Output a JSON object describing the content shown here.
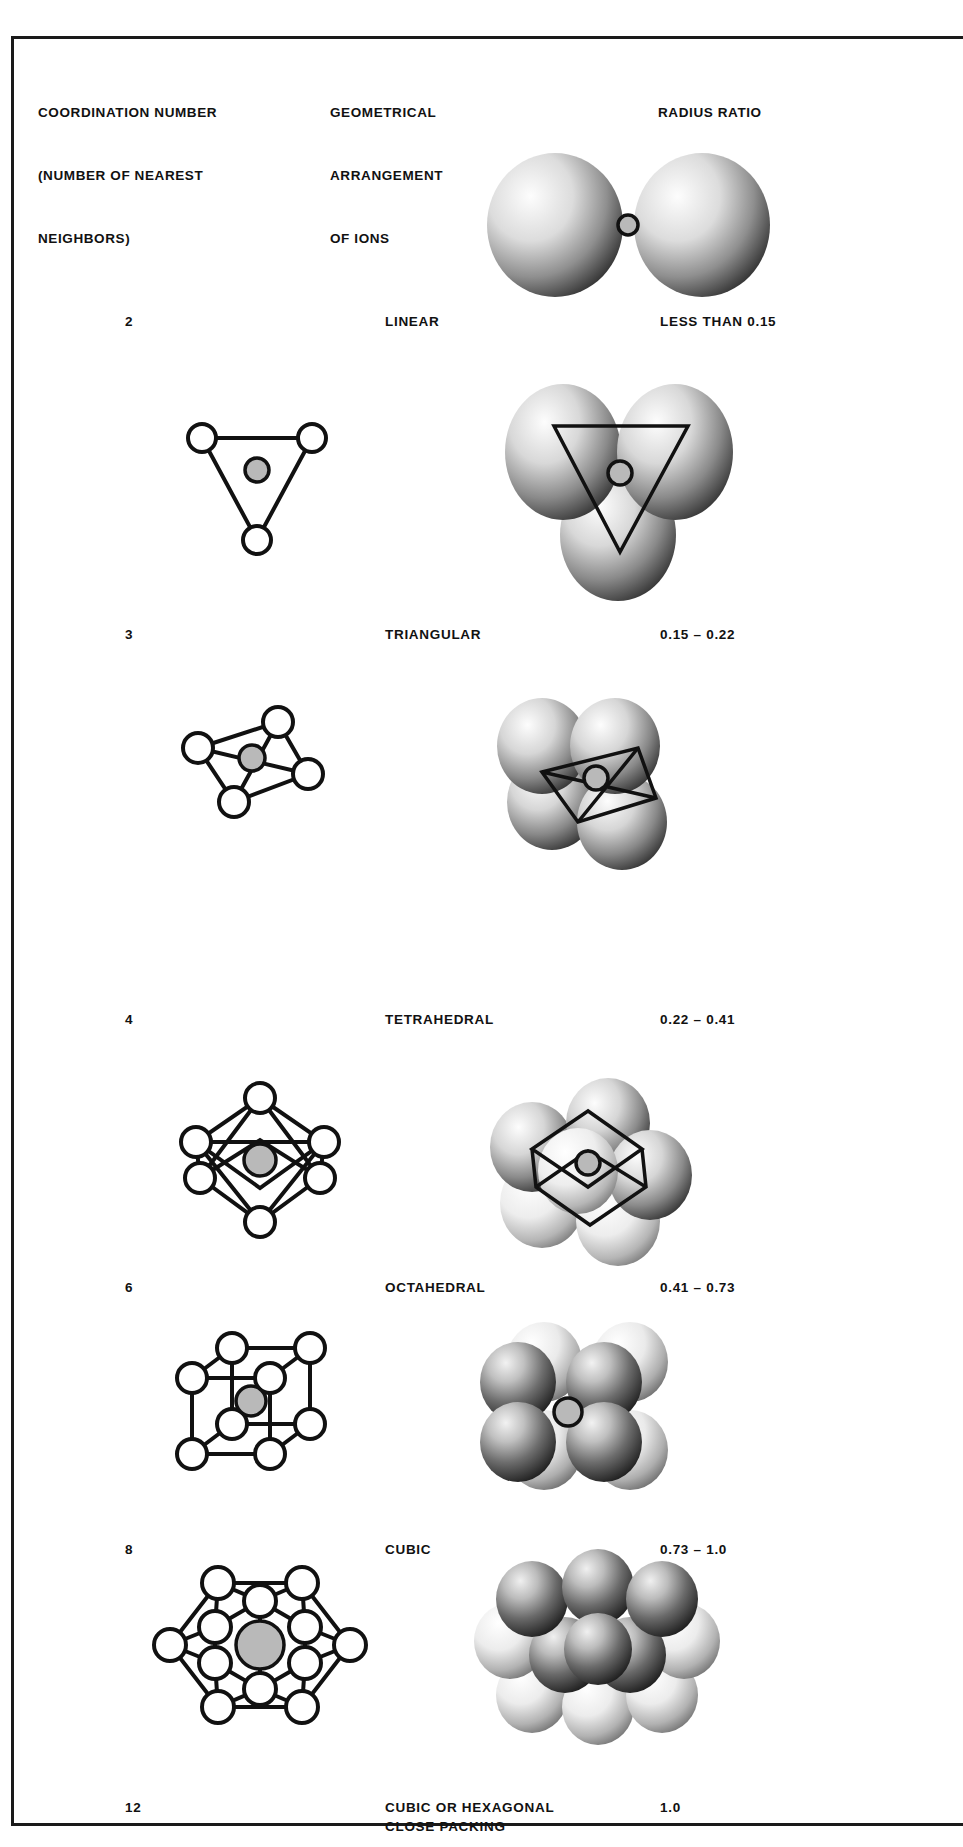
{
  "figure": {
    "headers": {
      "coordination": "COORDINATION NUMBER\n(NUMBER OF NEAREST\nNEIGHBORS)",
      "coordination_line1": "COORDINATION NUMBER",
      "coordination_line2": "(NUMBER OF NEAREST",
      "coordination_line3": "NEIGHBORS)",
      "geometry_line1": "GEOMETRICAL",
      "geometry_line2": "ARRANGEMENT",
      "geometry_line3": "OF IONS",
      "ratio_line1": "RADIUS RATIO",
      "ratio_line2": "LIMITS",
      "ratio_line3_prefix": "(r",
      "ratio_line3_sub1": "1",
      "ratio_line3_mid": "/r",
      "ratio_line3_sub2": "2",
      "ratio_line3_suffix": ")"
    },
    "rows": [
      {
        "coordination_number": "2",
        "arrangement": "LINEAR",
        "radius_ratio": "LESS THAN  0.15",
        "wireframe": "none",
        "packing": "two-spheres-linear"
      },
      {
        "coordination_number": "3",
        "arrangement": "TRIANGULAR",
        "radius_ratio": "0.15 – 0.22",
        "wireframe": "triangle-3-vertices",
        "packing": "three-spheres-triangular"
      },
      {
        "coordination_number": "4",
        "arrangement": "TETRAHEDRAL",
        "radius_ratio": "0.22 – 0.41",
        "wireframe": "tetrahedron-4-vertices",
        "packing": "four-spheres-tetrahedral"
      },
      {
        "coordination_number": "6",
        "arrangement": "OCTAHEDRAL",
        "radius_ratio": "0.41 – 0.73",
        "wireframe": "octahedron-6-vertices",
        "packing": "six-spheres-octahedral"
      },
      {
        "coordination_number": "8",
        "arrangement": "CUBIC",
        "radius_ratio": "0.73 – 1.0",
        "wireframe": "cube-8-vertices",
        "packing": "eight-spheres-cubic"
      },
      {
        "coordination_number": "12",
        "arrangement": "CUBIC OR HEXAGONAL\nCLOSE PACKING",
        "radius_ratio": "1.0",
        "wireframe": "cuboctahedron-12-vertices",
        "packing": "twelve-spheres-close-packed"
      }
    ],
    "colors": {
      "ink": "#111111",
      "center_ion_fill": "#b9b9b9",
      "vertex_ion_fill": "#ffffff",
      "background": "#ffffff"
    }
  }
}
